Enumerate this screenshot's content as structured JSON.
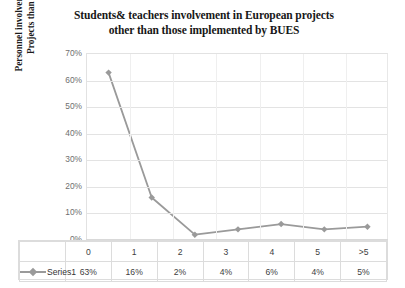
{
  "chart_data": {
    "type": "line",
    "title": "Students& teachers involvement in European projects other than those implemented by BUES",
    "title_line1": "Students& teachers involvement in European projects",
    "title_line2": "other than those implemented by BUES",
    "xlabel": "",
    "ylabel": "Personnel involvement in other European Projects than those within BUES",
    "ylabel_line1": "Personnel involvement in other European",
    "ylabel_line2": "Projects than those within BUES",
    "categories": [
      "0",
      "1",
      "2",
      "3",
      "4",
      "5",
      ">5"
    ],
    "values": [
      63,
      16,
      2,
      4,
      6,
      4,
      5
    ],
    "value_labels": [
      "63%",
      "16%",
      "2%",
      "4%",
      "6%",
      "4%",
      "5%"
    ],
    "series": [
      {
        "name": "Series1",
        "values": [
          63,
          16,
          2,
          4,
          6,
          4,
          5
        ]
      }
    ],
    "ylim": [
      0,
      70
    ],
    "ytick_values": [
      0,
      10,
      20,
      30,
      40,
      50,
      60,
      70
    ],
    "ytick_labels": [
      "0%",
      "10%",
      "20%",
      "30%",
      "40%",
      "50%",
      "60%",
      "70%"
    ],
    "grid": true,
    "legend_position": "data-table",
    "series_color": "#9a9a9a",
    "gridline_color": "#e3e3e3",
    "marker": "diamond"
  },
  "data_table": {
    "legend_label": "Series1",
    "header_row": [
      "0",
      "1",
      "2",
      "3",
      "4",
      "5",
      ">5"
    ],
    "value_row": [
      "63%",
      "16%",
      "2%",
      "4%",
      "6%",
      "4%",
      "5%"
    ]
  }
}
